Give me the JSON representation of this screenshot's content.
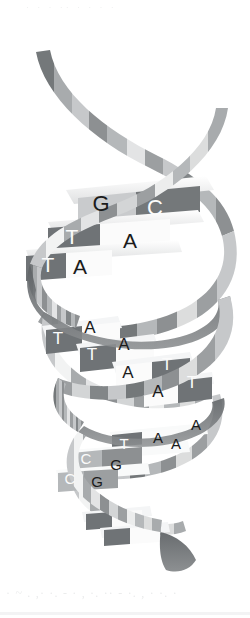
{
  "figure": {
    "style": "grayscale scanned illustration",
    "width": 250,
    "height": 618,
    "background_color": "#ffffff"
  },
  "palette": {
    "background": "#ffffff",
    "ribbon_white": "#fdfdfd",
    "ribbon_light": "#e3e4e5",
    "ribbon_mid_light": "#c6c8ca",
    "ribbon_mid": "#a8abad",
    "ribbon_mid_dark": "#8d9092",
    "ribbon_dark": "#74787a",
    "ribbon_darkest": "#5d6164",
    "rung_light": "#f4f5f6",
    "rung_mid": "#b5b8ba",
    "rung_dark": "#6f7376",
    "rung_darkest": "#565a5d",
    "text_dark": "#1b1b1b",
    "text_light": "#fbfbfb",
    "artifact": "#b9bcbe"
  },
  "strands": [
    {
      "name": "strand-front",
      "description": "front ribbon of the double helix"
    },
    {
      "name": "strand-back",
      "description": "back ribbon of the double helix"
    }
  ],
  "base_pairs": [
    {
      "id": "pair-1",
      "left_base": "G",
      "right_base": "C",
      "left_style": "dark-on-light",
      "right_style": "light-on-dark",
      "left_x": 101,
      "left_y": 204,
      "right_x": 155,
      "right_y": 208,
      "font_size": 22
    },
    {
      "id": "pair-2",
      "left_base": "T",
      "right_base": "A",
      "left_style": "light-on-dark",
      "right_style": "dark-on-light",
      "left_x": 72,
      "left_y": 236,
      "right_x": 130,
      "right_y": 240,
      "font_size": 21
    },
    {
      "id": "pair-3",
      "left_base": "T",
      "right_base": "A",
      "left_style": "light-on-dark",
      "right_style": "dark-on-light",
      "left_x": 48,
      "left_y": 264,
      "right_x": 80,
      "right_y": 266,
      "font_size": 21
    },
    {
      "id": "pair-4",
      "left_base": "T",
      "right_base": "A",
      "left_style": "light-on-dark",
      "right_style": "dark-on-light",
      "left_x": 58,
      "left_y": 338,
      "right_x": 90,
      "right_y": 327,
      "font_size": 17
    },
    {
      "id": "pair-5",
      "left_base": "T",
      "right_base": "A",
      "left_style": "light-on-dark",
      "right_style": "dark-on-light",
      "left_x": 92,
      "left_y": 354,
      "right_x": 124,
      "right_y": 344,
      "font_size": 17
    },
    {
      "id": "pair-6",
      "left_base": "A",
      "right_base": "T",
      "left_style": "dark-on-light",
      "right_style": "light-on-dark",
      "left_x": 128,
      "left_y": 372,
      "right_x": 167,
      "right_y": 364,
      "font_size": 17
    },
    {
      "id": "pair-7",
      "left_base": "A",
      "right_base": "T",
      "left_style": "dark-on-light",
      "right_style": "light-on-dark",
      "left_x": 158,
      "left_y": 391,
      "right_x": 192,
      "right_y": 382,
      "font_size": 17
    },
    {
      "id": "pair-8",
      "left_base": "T",
      "right_base": "A",
      "left_style": "light-on-dark",
      "right_style": "dark-on-light",
      "left_x": 124,
      "left_y": 443,
      "right_x": 158,
      "right_y": 437,
      "font_size": 15
    },
    {
      "id": "pair-9",
      "left_base": "C",
      "right_base": "G",
      "left_style": "light-on-mid",
      "right_style": "dark-on-mid",
      "left_x": 86,
      "left_y": 458,
      "right_x": 116,
      "right_y": 464,
      "font_size": 15
    },
    {
      "id": "pair-10",
      "left_base": "C",
      "right_base": "G",
      "left_style": "light-on-mid",
      "right_style": "dark-on-mid",
      "left_x": 70,
      "left_y": 478,
      "right_x": 97,
      "right_y": 481,
      "font_size": 15
    }
  ],
  "unpaired_bases": [
    {
      "id": "loose-a-upper",
      "base": "A",
      "style": "dark-on-light",
      "x": 196,
      "y": 424,
      "font_size": 15
    },
    {
      "id": "loose-a-lower",
      "base": "A",
      "style": "dark-on-light",
      "x": 176,
      "y": 443,
      "font_size": 15
    }
  ],
  "scan_artifacts": {
    "top_text": "· ·  ·   ·· ·   ·    ·  ·",
    "bottom_text": "·  ~ .  ,·   ·. -  ·  ,  ·.  ·· - ·.  ,  ·  ·. ·"
  }
}
